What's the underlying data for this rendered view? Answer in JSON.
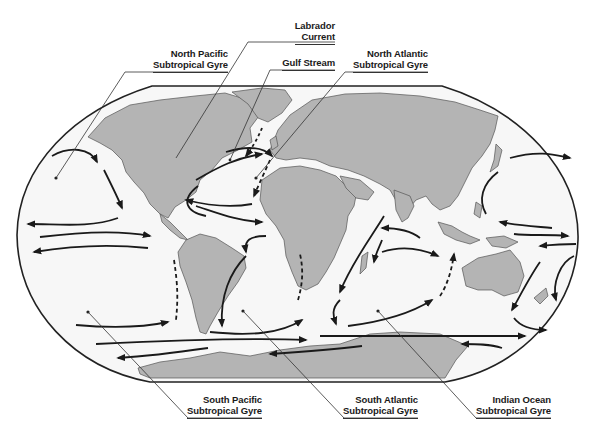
{
  "figure": {
    "colors": {
      "ocean": "#f7f7f7",
      "land": "#b4b4b4",
      "land_stroke": "#555555",
      "current_arrow": "#1a1a1a",
      "frame": "#222222",
      "leader_line": "#333333"
    }
  },
  "labels": {
    "labrador": {
      "line1": "Labrador",
      "line2": "Current"
    },
    "north_pacific": {
      "line1": "North Pacific",
      "line2": "Subtropical Gyre"
    },
    "gulf_stream": {
      "line1": "Gulf Stream"
    },
    "north_atlantic": {
      "line1": "North Atlantic",
      "line2": "Subtropical Gyre"
    },
    "south_pacific": {
      "line1": "South Pacific",
      "line2": "Subtropical Gyre"
    },
    "south_atlantic": {
      "line1": "South Atlantic",
      "line2": "Subtropical Gyre"
    },
    "indian_ocean": {
      "line1": "Indian Ocean",
      "line2": "Subtropical Gyre"
    }
  }
}
